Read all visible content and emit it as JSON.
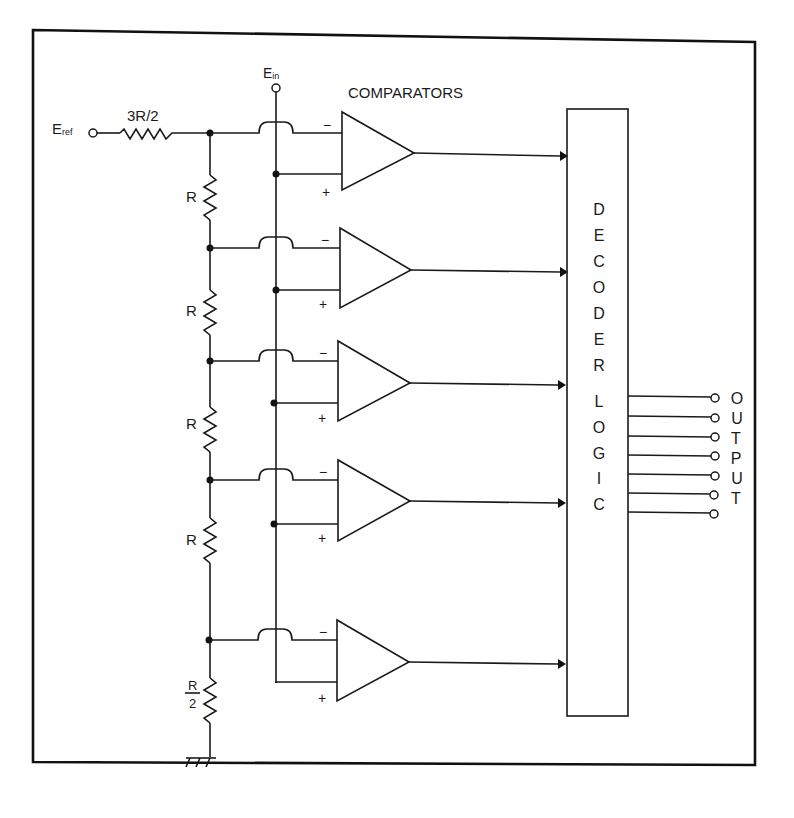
{
  "diagram": {
    "labels": {
      "eref_main": "E",
      "eref_sub": "ref",
      "ein_main": "E",
      "ein_sub": "in",
      "comparators": "COMPARATORS",
      "r_top": "3R/2",
      "r1": "R",
      "r2": "R",
      "r3": "R",
      "r4": "R",
      "r_bottom_num": "R",
      "r_bottom_den": "2",
      "minus": "−",
      "plus": "+"
    },
    "decoder_letters": [
      "D",
      "E",
      "C",
      "O",
      "D",
      "E",
      "R",
      "L",
      "O",
      "G",
      "I",
      "C"
    ],
    "output_letters": [
      "O",
      "U",
      "T",
      "P",
      "U",
      "T"
    ],
    "output_lines": 7,
    "comparator_count": 5,
    "colors": {
      "ink": "#1a1a1a",
      "background": "#ffffff"
    }
  }
}
